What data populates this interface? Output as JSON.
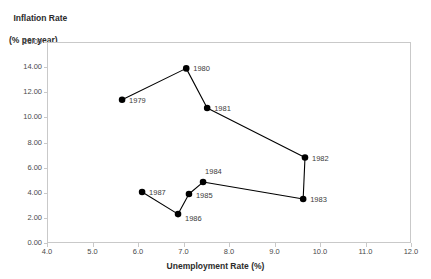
{
  "chart_data": {
    "type": "line",
    "title": "",
    "ylabel_line1": "Inflation Rate",
    "ylabel_line2": "(% per year)",
    "xlabel": "Unemployment Rate (%)",
    "xlim": [
      4.0,
      12.0
    ],
    "ylim": [
      0.0,
      16.0
    ],
    "xticks": [
      "4.0",
      "5.0",
      "6.0",
      "7.0",
      "8.0",
      "9.0",
      "10.0",
      "11.0",
      "12.0"
    ],
    "yticks": [
      "0.00",
      "2.00",
      "4.00",
      "6.00",
      "8.00",
      "10.00",
      "12.00",
      "14.00",
      "16.00"
    ],
    "grid": false,
    "legend": "none",
    "series_name": "Phillips curve path 1979-1987",
    "marker_color": "#000000",
    "line_color": "#000000",
    "axis_color": "#c9c9c9",
    "points": [
      {
        "label": "1979",
        "x": 5.65,
        "y": 11.4,
        "label_dx": 7,
        "label_dy": -3
      },
      {
        "label": "1980",
        "x": 7.06,
        "y": 13.9,
        "label_dx": 7,
        "label_dy": -3
      },
      {
        "label": "1981",
        "x": 7.52,
        "y": 10.75,
        "label_dx": 7,
        "label_dy": -3
      },
      {
        "label": "1982",
        "x": 9.67,
        "y": 6.8,
        "label_dx": 7,
        "label_dy": -3
      },
      {
        "label": "1983",
        "x": 9.63,
        "y": 3.5,
        "label_dx": 7,
        "label_dy": -3
      },
      {
        "label": "1984",
        "x": 7.43,
        "y": 4.85,
        "label_dx": 2,
        "label_dy": -14
      },
      {
        "label": "1985",
        "x": 7.12,
        "y": 3.9,
        "label_dx": 7,
        "label_dy": -2
      },
      {
        "label": "1986",
        "x": 6.88,
        "y": 2.3,
        "label_dx": 7,
        "label_dy": 1
      },
      {
        "label": "1987",
        "x": 6.09,
        "y": 4.06,
        "label_dx": 7,
        "label_dy": -3
      }
    ]
  }
}
